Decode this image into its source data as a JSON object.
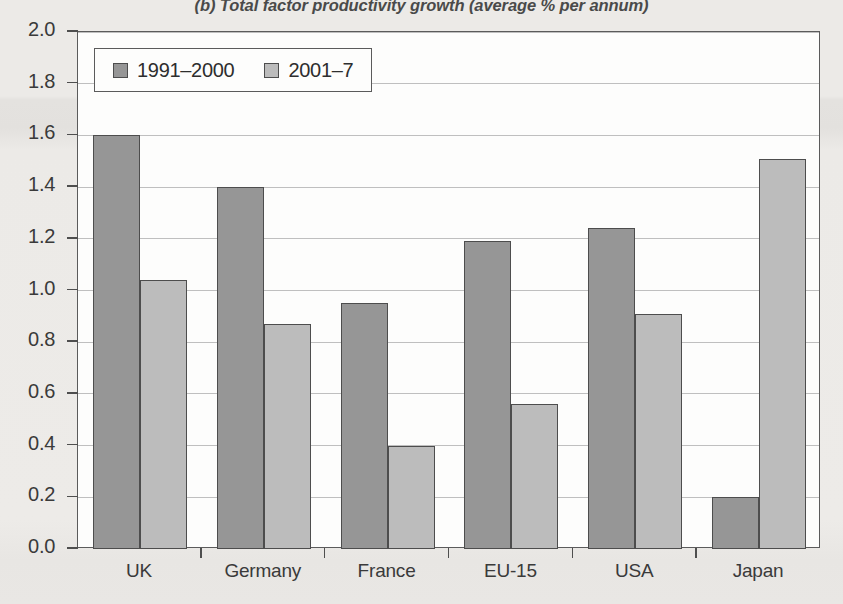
{
  "chart_data": {
    "type": "bar",
    "title": "(b) Total factor productivity growth (average % per annum)",
    "xlabel": "",
    "ylabel": "",
    "ylim": [
      0.0,
      2.0
    ],
    "ytick_step": 0.2,
    "grid": true,
    "legend_position": "top-left-inside",
    "categories": [
      "UK",
      "Germany",
      "France",
      "EU-15",
      "USA",
      "Japan"
    ],
    "series": [
      {
        "name": "1991–2000",
        "color": "#969696",
        "values": [
          1.6,
          1.4,
          0.95,
          1.19,
          1.24,
          0.2
        ]
      },
      {
        "name": "2001–7",
        "color": "#bcbcbc",
        "values": [
          1.04,
          0.87,
          0.4,
          0.56,
          0.91,
          1.51
        ]
      }
    ],
    "ytick_labels": [
      "0.0",
      "0.2",
      "0.4",
      "0.6",
      "0.8",
      "1.0",
      "1.2",
      "1.4",
      "1.6",
      "1.8",
      "2.0"
    ]
  },
  "colors": {
    "series_1": "#969696",
    "series_2": "#bcbcbc",
    "bar_outline": "#4d4d4d",
    "axis": "#5b5b5b",
    "gridline": "#9a9a9a",
    "plot_background": "#fdfdfc",
    "page_background": "#eceae7",
    "text": "#3a3a3a"
  }
}
